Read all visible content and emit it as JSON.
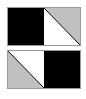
{
  "diagram": {
    "title": "",
    "colors": {
      "solid": "#000000",
      "shade": "#c0c0c0",
      "blank": "#ffffff",
      "border": "#9a9a9a"
    },
    "rows": [
      {
        "cells": [
          {
            "type": "solid"
          },
          {
            "type": "diagonal",
            "shaded_half": "top-right",
            "diagonal": "top-left-to-bottom-right"
          }
        ]
      },
      {
        "cells": [
          {
            "type": "diagonal",
            "shaded_half": "bottom-left",
            "diagonal": "top-left-to-bottom-right"
          },
          {
            "type": "solid"
          }
        ]
      }
    ]
  }
}
